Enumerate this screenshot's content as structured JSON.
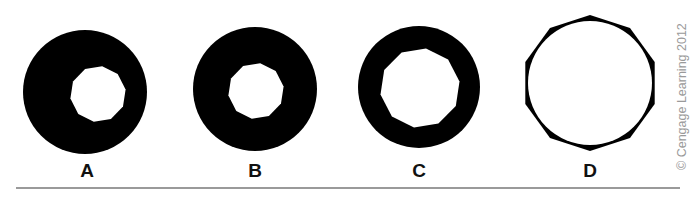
{
  "figure": {
    "panels": [
      {
        "label": "A",
        "outer": {
          "cx": 85,
          "cy": 92,
          "r": 62
        },
        "inner": {
          "cx": 98,
          "cy": 94,
          "r": 28,
          "sides": 10
        }
      },
      {
        "label": "B",
        "outer": {
          "cx": 255,
          "cy": 89,
          "r": 62
        },
        "inner": {
          "cx": 256,
          "cy": 91,
          "r": 28,
          "sides": 10
        }
      },
      {
        "label": "C",
        "outer": {
          "cx": 419,
          "cy": 87,
          "r": 61
        },
        "inner": {
          "cx": 420,
          "cy": 88,
          "r": 40,
          "sides": 10
        }
      },
      {
        "label": "D",
        "outer": {
          "cx": 590,
          "cy": 83,
          "r": 68,
          "sides": 10
        },
        "inner": {
          "cx": 590,
          "cy": 83,
          "r": 62
        }
      }
    ],
    "credit": "© Cengage Learning 2012"
  },
  "colors": {
    "shape": "#000000",
    "background": "#ffffff",
    "rule": "#9a9a9a",
    "credit": "#9a9a9a"
  }
}
